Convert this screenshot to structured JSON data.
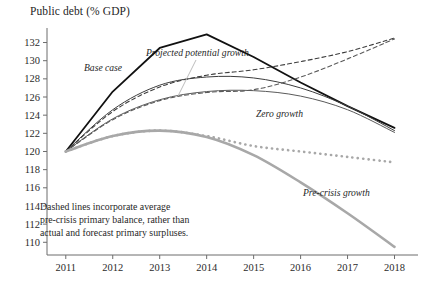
{
  "chart_data": {
    "type": "line",
    "title": "Public debt (% GDP)",
    "xlabel": "",
    "ylabel": "",
    "grid": false,
    "legend": "inline-annotations",
    "x": [
      2011,
      2012,
      2013,
      2014,
      2015,
      2016,
      2017,
      2018
    ],
    "xtick_labels": [
      "2011",
      "2012",
      "2013",
      "2014",
      "2015",
      "2016",
      "2017",
      "2018"
    ],
    "ytick_labels": [
      "110",
      "112",
      "114",
      "116",
      "118",
      "120",
      "122",
      "124",
      "126",
      "128",
      "130",
      "132"
    ],
    "ylim": [
      108.6,
      133.6
    ],
    "xlim": [
      2010.6,
      2018.5
    ],
    "series": [
      {
        "name": "Base case",
        "style": "solid",
        "color": "#111111",
        "width": 1.8,
        "values": [
          120.0,
          126.6,
          131.4,
          132.9,
          130.4,
          127.6,
          125.0,
          122.6
        ]
      },
      {
        "name": "Projected potential growth",
        "style": "solid",
        "color": "#3d3d3d",
        "width": 1.0,
        "values": [
          120.0,
          124.6,
          127.3,
          128.2,
          128.1,
          127.0,
          125.0,
          122.3
        ]
      },
      {
        "name": "Projected potential growth (dashed)",
        "style": "dashed",
        "color": "#3d3d3d",
        "width": 1.1,
        "values": [
          120.0,
          124.4,
          127.1,
          128.4,
          129.0,
          129.9,
          131.0,
          132.5
        ]
      },
      {
        "name": "Zero growth",
        "style": "solid",
        "color": "#5a5a5a",
        "width": 1.0,
        "values": [
          120.0,
          123.6,
          125.7,
          126.6,
          126.7,
          126.1,
          124.6,
          122.1
        ]
      },
      {
        "name": "Zero growth (dashed)",
        "style": "dashed",
        "color": "#5a5a5a",
        "width": 1.1,
        "values": [
          120.0,
          123.5,
          125.6,
          126.5,
          126.8,
          128.2,
          130.2,
          132.4
        ]
      },
      {
        "name": "Pre-crisis growth",
        "style": "solid",
        "color": "#a8a8a8",
        "width": 2.6,
        "values": [
          120.0,
          121.7,
          122.3,
          121.6,
          119.6,
          116.6,
          113.2,
          109.5
        ]
      },
      {
        "name": "Pre-crisis growth (dashed)",
        "style": "dashed",
        "color": "#a8a8a8",
        "width": 2.6,
        "values": [
          120.0,
          121.7,
          122.3,
          121.7,
          120.6,
          120.0,
          119.4,
          118.8
        ]
      }
    ],
    "annotations": [
      {
        "text": "Base case",
        "x": 84,
        "y": 71,
        "rotation": 0
      },
      {
        "text": "Projected potential growth",
        "x": 146,
        "y": 56,
        "rotation": 0
      },
      {
        "text": "Zero growth",
        "x": 256,
        "y": 117,
        "rotation": 0
      },
      {
        "text": "Pre-crisis growth",
        "x": 303,
        "y": 196,
        "rotation": 0
      }
    ],
    "note": [
      "Dashed lines incorporate average",
      "pre-crisis primary balance, rather than",
      "actual and forecast primary surpluses."
    ]
  },
  "colors": {
    "axis": "#6d6d6d",
    "text": "#1f1f1f",
    "base_case": "#111111",
    "pre_crisis": "#a8a8a8"
  }
}
